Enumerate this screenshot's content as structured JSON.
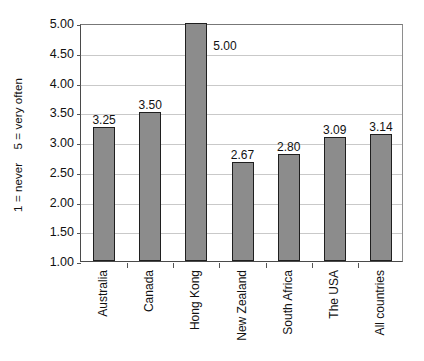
{
  "chart_data": {
    "type": "bar",
    "title": "",
    "xlabel": "",
    "ylabel": "1 = never    5 = very often",
    "categories": [
      "Australia",
      "Canada",
      "Hong Kong",
      "New Zealand",
      "South Africa",
      "The USA",
      "All countries"
    ],
    "values": [
      3.25,
      3.5,
      5.0,
      2.67,
      2.8,
      3.09,
      3.14
    ],
    "value_labels": [
      "3.25",
      "3.50",
      "5.00",
      "2.67",
      "2.80",
      "3.09",
      "3.14"
    ],
    "ylim": [
      1.0,
      5.0
    ],
    "ytick_values": [
      5.0,
      4.5,
      4.0,
      3.5,
      3.0,
      2.5,
      2.0,
      1.5,
      1.0
    ],
    "ytick_labels": [
      "5.00",
      "4.50",
      "4.00",
      "3.50",
      "3.00",
      "2.50",
      "2.00",
      "1.50",
      "1.00"
    ],
    "grid": true,
    "legend": false,
    "legend_position": "none",
    "series": [
      {
        "name": "",
        "values": [
          3.25,
          3.5,
          5.0,
          2.67,
          2.8,
          3.09,
          3.14
        ],
        "color": "#8c8c8c"
      }
    ],
    "colors": {
      "bar_fill": "#8c8c8c",
      "bar_border": "#1f1f1f",
      "gridline": "#c9c9c9",
      "axis": "#4a4a4a",
      "background": "#ffffff",
      "text": "#111111"
    }
  }
}
